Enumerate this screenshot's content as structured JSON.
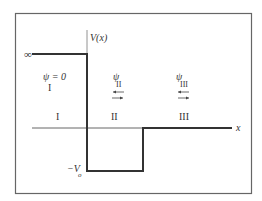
{
  "diagram": {
    "axis_y_label": "V(x)",
    "axis_x_label": "x",
    "infinity_label": "∞",
    "well_depth_label": "−V",
    "well_depth_subscript": "o",
    "regions": [
      {
        "id": "I",
        "label": "I",
        "psi_label": "ψ = 0"
      },
      {
        "id": "II",
        "label": "II",
        "psi_symbol": "ψ",
        "psi_subscript": "II"
      },
      {
        "id": "III",
        "label": "III",
        "psi_symbol": "ψ",
        "psi_subscript": "III"
      }
    ],
    "colors": {
      "frame": "#555555",
      "potential": "#333333",
      "axis": "#444444",
      "text": "#333333"
    }
  }
}
